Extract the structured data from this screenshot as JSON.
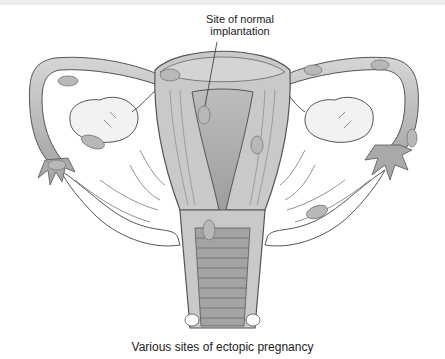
{
  "figure": {
    "label_normal_site": "Site of normal\nimplantation",
    "label_normal_site_line1": "Site of normal",
    "label_normal_site_line2": "implantation",
    "caption": "Various sites of ectopic pregnancy",
    "colors": {
      "tissue_fill": "#c9c9c9",
      "tissue_dark": "#9a9a9a",
      "ovary_fill": "#f2f2f2",
      "outline": "#555555",
      "background": "#ffffff",
      "embryo_fill": "#b8b8b8"
    },
    "structures": [
      "uterus",
      "left-fallopian-tube",
      "right-fallopian-tube",
      "left-ovary",
      "right-ovary",
      "broad-ligament",
      "cervix",
      "vagina"
    ],
    "ectopic_sites": [
      "left-tube-ampulla",
      "left-ovary",
      "left-fimbria",
      "left-interstitial",
      "right-interstitial",
      "right-tube-ampulla",
      "right-tube-distal",
      "uterine-wall",
      "cervical",
      "broad-ligament",
      "abdominal-left",
      "abdominal-right"
    ]
  }
}
